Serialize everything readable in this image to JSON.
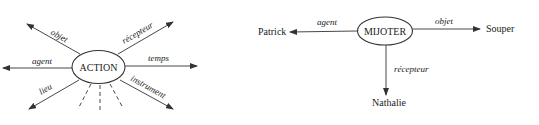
{
  "left_diagram": {
    "center": "ACTION",
    "relations": {
      "objet": "objet",
      "agent": "agent",
      "lieu": "lieu",
      "recepteur": "récepteur",
      "temps": "temps",
      "instrument": "instrument"
    },
    "open_ended_dashed_lines": 3
  },
  "right_diagram": {
    "center": "MIJOTER",
    "nodes": {
      "agent_target": "Patrick",
      "objet_target": "Souper",
      "recepteur_target": "Nathalie"
    },
    "relations": {
      "agent": "agent",
      "objet": "objet",
      "recepteur": "récepteur"
    }
  },
  "colors": {
    "stroke": "#333333",
    "text": "#222222",
    "background": "#ffffff"
  }
}
